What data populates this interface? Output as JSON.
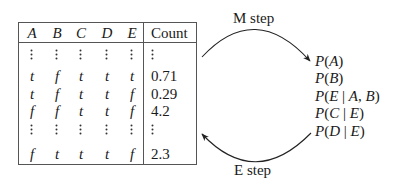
{
  "table": {
    "headers": [
      "A",
      "B",
      "C",
      "D",
      "E",
      "Count"
    ],
    "rows": [
      {
        "type": "ellipsis",
        "cells": [
          "⋮",
          "⋮",
          "⋮",
          "⋮",
          "⋮"
        ],
        "count": "⋮"
      },
      {
        "type": "data",
        "cells": [
          "t",
          "f",
          "t",
          "t",
          "t"
        ],
        "count": "0.71"
      },
      {
        "type": "data",
        "cells": [
          "t",
          "f",
          "t",
          "t",
          "f"
        ],
        "count": "0.29"
      },
      {
        "type": "data",
        "cells": [
          "f",
          "f",
          "t",
          "t",
          "f"
        ],
        "count": "4.2"
      },
      {
        "type": "ellipsis",
        "cells": [
          "⋮",
          "⋮",
          "⋮",
          "⋮",
          "⋮"
        ],
        "count": "⋮"
      },
      {
        "type": "data",
        "cells": [
          "f",
          "t",
          "t",
          "t",
          "f"
        ],
        "count": "2.3"
      }
    ]
  },
  "arrows": {
    "m_step_label": "M step",
    "e_step_label": "E step"
  },
  "parameters": [
    "P(A)",
    "P(B)",
    "P(E | A, B)",
    "P(C | E)",
    "P(D | E)"
  ]
}
